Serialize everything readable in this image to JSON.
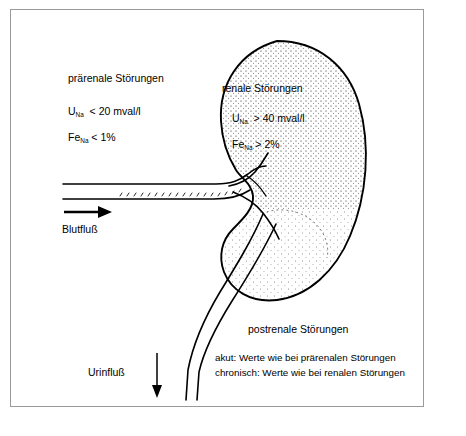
{
  "figure": {
    "border_color": "#9a9a9a",
    "ink_color": "#000000",
    "background": "#ffffff"
  },
  "prerenal": {
    "title": "prärenale Störungen",
    "value1_prefix": "U",
    "value1_sub": "Na",
    "value1_text": "< 20 mval/l",
    "value2_prefix": "Fe",
    "value2_sub": "Na",
    "value2_text": "< 1%"
  },
  "renal": {
    "title": "renale Störungen",
    "value1_prefix": "U",
    "value1_sub": "Na",
    "value1_text": "> 40 mval/l",
    "value2_prefix": "Fe",
    "value2_sub": "Na",
    "value2_text": "> 2%"
  },
  "postrenal": {
    "title": "postrenale Störungen",
    "line1": "akut: Werte wie bei prärenalen Störungen",
    "line2": "chronisch: Werte wie bei renalen Störungen"
  },
  "flows": {
    "blood_label": "Blutfluß",
    "urine_label": "Urinfluß",
    "blood_arrow": "arrow-right-icon",
    "urine_arrow": "arrow-down-icon"
  },
  "anatomy": {
    "kidney": "kidney-outline",
    "renal_vessels": "renal-vessels",
    "ureter": "ureter"
  }
}
